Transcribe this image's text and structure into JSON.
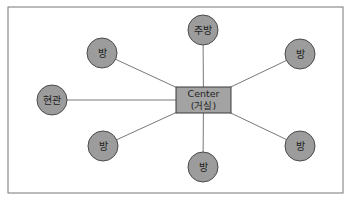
{
  "diagram": {
    "type": "star-layout",
    "colors": {
      "frame": "#777777",
      "line": "#555555",
      "node_fill": "#9c9c9c",
      "node_stroke": "#4a4a4a",
      "center_fill": "#a3a3a3",
      "center_stroke": "#3a3a3a",
      "text": "#222222"
    },
    "center": {
      "line1": "Center",
      "line2": "(거실)",
      "x": 176,
      "y": 87,
      "width": 55,
      "height": 26
    },
    "nodes": [
      {
        "id": "kitchen",
        "label": "주방",
        "cx": 203,
        "cy": 30
      },
      {
        "id": "room-top-left",
        "label": "방",
        "cx": 102,
        "cy": 53
      },
      {
        "id": "room-top-right",
        "label": "방",
        "cx": 300,
        "cy": 54
      },
      {
        "id": "entrance",
        "label": "현관",
        "cx": 52,
        "cy": 100
      },
      {
        "id": "room-bottom-left",
        "label": "방",
        "cx": 103,
        "cy": 146
      },
      {
        "id": "room-bottom-right",
        "label": "방",
        "cx": 300,
        "cy": 146
      },
      {
        "id": "room-bottom",
        "label": "방",
        "cx": 203,
        "cy": 167
      }
    ]
  }
}
